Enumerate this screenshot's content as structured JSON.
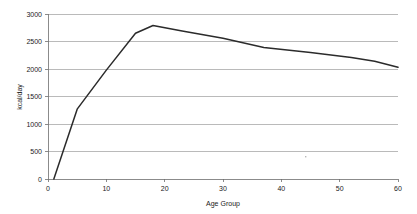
{
  "chart_data": {
    "type": "line",
    "title": "",
    "xlabel": "Age Group",
    "ylabel": "kcal/day",
    "xlim": [
      0,
      60
    ],
    "ylim": [
      0,
      3000
    ],
    "grid": true,
    "legend": false,
    "legend_position": "none",
    "line_color": "#2b2b2b",
    "grid_color": "#9c9c9c",
    "axis_color": "#6e6e6e",
    "background_color": "#ffffff",
    "x_ticks": [
      0,
      10,
      20,
      30,
      40,
      50,
      60
    ],
    "x_tick_labels": [
      "0",
      "10",
      "20",
      "30",
      "40",
      "50",
      "60"
    ],
    "y_ticks": [
      0,
      500,
      1000,
      1500,
      2000,
      2500,
      3000
    ],
    "y_tick_labels": [
      "0",
      "500",
      "1000",
      "1500",
      "2000",
      "2500",
      "3000"
    ],
    "series": [
      {
        "name": "Energy requirement",
        "x": [
          1,
          5,
          10,
          15,
          18,
          23,
          30,
          37,
          45,
          52,
          56,
          60
        ],
        "values": [
          0,
          1270,
          1980,
          2650,
          2790,
          2690,
          2560,
          2390,
          2300,
          2210,
          2140,
          2030
        ]
      }
    ]
  },
  "axis_titles": {
    "x": "Age Group",
    "y": "kcal/day"
  }
}
